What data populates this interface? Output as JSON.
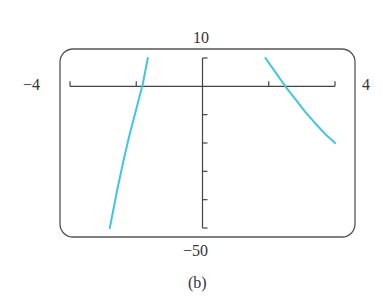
{
  "chart_data": {
    "type": "line",
    "title": "",
    "caption": "(b)",
    "xlabel": "",
    "ylabel": "",
    "xlim": [
      -4,
      4
    ],
    "ylim": [
      -50,
      10
    ],
    "window_labels": {
      "xmin": "−4",
      "xmax": "4",
      "ymax": "10",
      "ymin": "−50"
    },
    "x_ticks": [
      -4,
      -2,
      0,
      2,
      4
    ],
    "y_ticks": [
      10,
      0,
      -10,
      -20,
      -30,
      -40,
      -50
    ],
    "grid": false,
    "legend": null,
    "line_color": "#3fc6e0",
    "series": [
      {
        "name": "left branch",
        "x": [
          -2.8,
          -2.6,
          -2.4,
          -2.2,
          -2.0,
          -1.8,
          -1.65
        ],
        "y": [
          -50,
          -38,
          -27,
          -17,
          -8,
          1,
          10
        ]
      },
      {
        "name": "right branch",
        "x": [
          1.9,
          2.2,
          2.5,
          2.8,
          3.1,
          3.4,
          3.7,
          4.0
        ],
        "y": [
          10,
          5,
          0,
          -4.5,
          -9,
          -13,
          -16.8,
          -20
        ]
      }
    ]
  }
}
